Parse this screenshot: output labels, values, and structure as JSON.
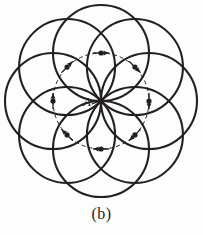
{
  "figure": {
    "caption": "(b)",
    "center_label": "A",
    "colors": {
      "background": "#fdfdfd",
      "stroke": "#231f20",
      "dashed_stroke": "#231f20",
      "marker_fill": "#231f20",
      "label": "#231f20"
    },
    "geometry": {
      "center_x": 101,
      "center_y": 101,
      "circle_radius": 48,
      "locus_radius": 48,
      "circle_count": 8,
      "outer_extent_radius": 96,
      "stroke_width": 2.1,
      "dashed_stroke_width": 1.0,
      "dash_pattern": "4 3",
      "marker_radius": 2.6
    },
    "circle_centers": [
      {
        "index": 1,
        "angle_deg": 90,
        "x": 101,
        "y": 53,
        "label": "top"
      },
      {
        "index": 2,
        "angle_deg": 45,
        "x": 135,
        "y": 67,
        "label": "upper-right"
      },
      {
        "index": 3,
        "angle_deg": 0,
        "x": 149,
        "y": 101,
        "label": "right"
      },
      {
        "index": 4,
        "angle_deg": 315,
        "x": 135,
        "y": 135,
        "label": "lower-right"
      },
      {
        "index": 5,
        "angle_deg": 270,
        "x": 101,
        "y": 149,
        "label": "bottom"
      },
      {
        "index": 6,
        "angle_deg": 225,
        "x": 67,
        "y": 135,
        "label": "lower-left"
      },
      {
        "index": 7,
        "angle_deg": 180,
        "x": 53,
        "y": 101,
        "label": "left"
      },
      {
        "index": 8,
        "angle_deg": 135,
        "x": 67,
        "y": 67,
        "label": "upper-left"
      }
    ],
    "label_position": {
      "x": 86,
      "y": 106
    },
    "leader_line": {
      "x1": 92,
      "y1": 104,
      "x2": 100,
      "y2": 101
    }
  }
}
